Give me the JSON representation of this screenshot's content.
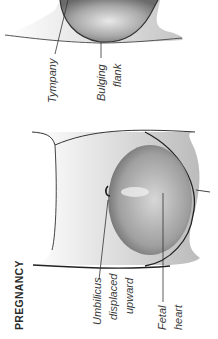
{
  "section_title": "PREGNANCY",
  "labels": {
    "tympany": "Tympany",
    "bulging_flank_1": "Bulging",
    "bulging_flank_2": "flank",
    "umbilicus_1": "Umbilicus",
    "umbilicus_2": "displaced",
    "umbilicus_3": "upward",
    "fetal_1": "Fetal",
    "fetal_2": "heart"
  }
}
